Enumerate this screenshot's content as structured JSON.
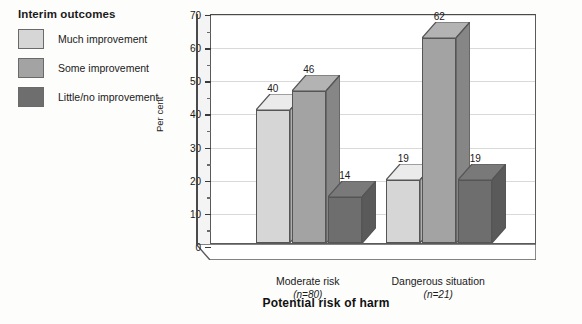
{
  "legend": {
    "title": "Interim outcomes",
    "items": [
      {
        "label": "Much improvement",
        "color": "#d6d6d6"
      },
      {
        "label": "Some improvement",
        "color": "#a3a3a3"
      },
      {
        "label": "Little/no improvement",
        "color": "#6e6e6e"
      }
    ]
  },
  "chart_data": {
    "type": "bar",
    "title": "",
    "xlabel": "Potential risk of harm",
    "ylabel": "Per cent",
    "ylim": [
      0,
      70
    ],
    "ytick_step": 10,
    "yticks": [
      "0",
      "10",
      "20",
      "30",
      "40",
      "50",
      "60",
      "70"
    ],
    "minor_tick_step": 5,
    "grid": true,
    "legend_position": "top-left-outside",
    "categories": [
      "Moderate risk",
      "Dangerous situation"
    ],
    "category_sublabels": [
      "(n=80)",
      "(n=21)"
    ],
    "series": [
      {
        "name": "Much improvement",
        "color": "#d6d6d6",
        "values": [
          40,
          19
        ]
      },
      {
        "name": "Some improvement",
        "color": "#a3a3a3",
        "values": [
          46,
          62
        ]
      },
      {
        "name": "Little/no improvement",
        "color": "#6e6e6e",
        "values": [
          14,
          19
        ]
      }
    ],
    "data_labels": [
      "40",
      "46",
      "14",
      "19",
      "62",
      "19"
    ]
  },
  "colors": {
    "light": "#d6d6d6",
    "medium": "#a3a3a3",
    "dark": "#6e6e6e",
    "grid": "#d9d9d9",
    "axis": "#4a4a4a",
    "background": "#fdfdfc"
  }
}
